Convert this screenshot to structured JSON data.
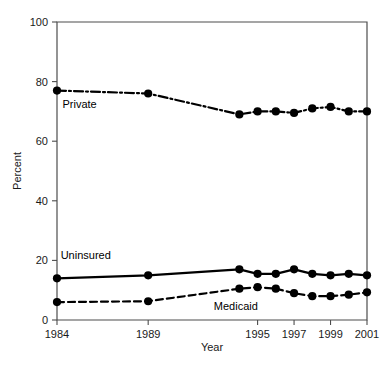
{
  "chart_data": {
    "type": "line",
    "title": "",
    "subtitle": "",
    "xlabel": "Year",
    "ylabel": "Percent",
    "xlim": [
      1984,
      2001
    ],
    "ylim": [
      0,
      100
    ],
    "grid": false,
    "legend_position": "inline-labels",
    "y_ticks": [
      "0",
      "20",
      "40",
      "60",
      "80",
      "100"
    ],
    "y_tick_values": [
      0,
      20,
      40,
      60,
      80,
      100
    ],
    "x_ticks": [
      "1984",
      "1989",
      "1995",
      "1997",
      "1999",
      "2001"
    ],
    "x_tick_values": [
      1984,
      1989,
      1995,
      1997,
      1999,
      2001
    ],
    "x": [
      1984,
      1989,
      1994,
      1995,
      1996,
      1997,
      1998,
      1999,
      2000,
      2001
    ],
    "series": [
      {
        "name": "Private",
        "label": "Private",
        "style": "dash-dot",
        "color": "#000000",
        "values": [
          77,
          76,
          69,
          70,
          70,
          69.5,
          71,
          71.5,
          70,
          70
        ]
      },
      {
        "name": "Uninsured",
        "label": "Uninsured",
        "style": "solid",
        "color": "#000000",
        "values": [
          14,
          15,
          17,
          15.5,
          15.5,
          17,
          15.5,
          15,
          15.5,
          15
        ]
      },
      {
        "name": "Medicaid",
        "label": "Medicaid",
        "style": "dashed",
        "color": "#000000",
        "values": [
          6,
          6.3,
          10.5,
          11,
          10.5,
          9,
          8,
          8,
          8.5,
          9.3
        ]
      }
    ],
    "annotations": [
      {
        "text": "Private",
        "x": 1984.3,
        "y": 71
      },
      {
        "text": "Uninsured",
        "x": 1984.2,
        "y": 20.5
      },
      {
        "text": "Medicaid",
        "x": 1992.6,
        "y": 3.2
      }
    ]
  }
}
